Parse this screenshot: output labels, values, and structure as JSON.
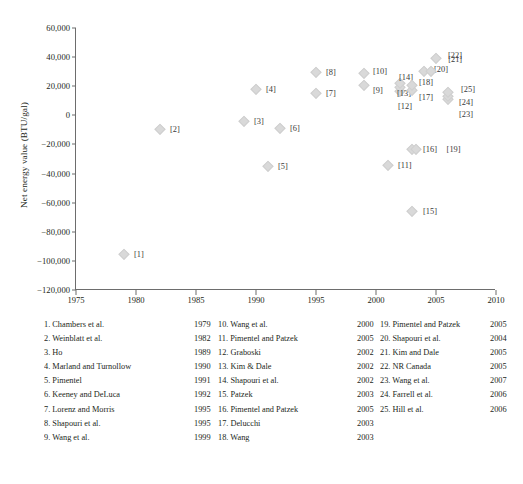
{
  "chart_data": {
    "type": "scatter",
    "title": "",
    "xlabel": "",
    "ylabel": "Net energy value (BTU/gal)",
    "xlim": [
      1975,
      2010
    ],
    "ylim": [
      -120000,
      60000
    ],
    "xticks": [
      "1975",
      "1980",
      "1985",
      "1990",
      "1995",
      "2000",
      "2005",
      "2010"
    ],
    "xtick_values": [
      1975,
      1980,
      1985,
      1990,
      1995,
      2000,
      2005,
      2010
    ],
    "yticks": [
      "60,000",
      "40,000",
      "20,000",
      "0",
      "−20,000",
      "−40,000",
      "−60,000",
      "−80,000",
      "−100,000",
      "−120,000"
    ],
    "ytick_values": [
      60000,
      40000,
      20000,
      0,
      -20000,
      -40000,
      -60000,
      -80000,
      -100000,
      -120000
    ],
    "grid": false,
    "legend": "none",
    "marker": "diamond",
    "marker_color": "#d9d9d9",
    "points": [
      {
        "id": "1",
        "label": "[1]",
        "x": 1979,
        "y": -95000,
        "lx": 10,
        "ly": 0
      },
      {
        "id": "2",
        "label": "[2]",
        "x": 1982,
        "y": -9500,
        "lx": 10,
        "ly": 0
      },
      {
        "id": "3",
        "label": "[3]",
        "x": 1989,
        "y": -4000,
        "lx": 10,
        "ly": 0
      },
      {
        "id": "4",
        "label": "[4]",
        "x": 1990,
        "y": 18000,
        "lx": 10,
        "ly": 0
      },
      {
        "id": "5",
        "label": "[5]",
        "x": 1991,
        "y": -35000,
        "lx": 10,
        "ly": 0
      },
      {
        "id": "6",
        "label": "[6]",
        "x": 1992,
        "y": -9000,
        "lx": 10,
        "ly": 0
      },
      {
        "id": "7",
        "label": "[7]",
        "x": 1995,
        "y": 15500,
        "lx": 10,
        "ly": 0
      },
      {
        "id": "8",
        "label": "[8]",
        "x": 1995,
        "y": 30000,
        "lx": 10,
        "ly": 0
      },
      {
        "id": "9",
        "label": "[9]",
        "x": 1999,
        "y": 20500,
        "lx": 9,
        "ly": 5
      },
      {
        "id": "10",
        "label": "[10]",
        "x": 1999,
        "y": 29000,
        "lx": 9,
        "ly": -2
      },
      {
        "id": "11",
        "label": "[11]",
        "x": 2001,
        "y": -34000,
        "lx": 10,
        "ly": 0
      },
      {
        "id": "12",
        "label": "[12]",
        "x": 2002,
        "y": 16500,
        "lx": -2,
        "ly": 15
      },
      {
        "id": "13",
        "label": "[13]",
        "x": 2002,
        "y": 19500,
        "lx": -3,
        "ly": 6
      },
      {
        "id": "14",
        "label": "[14]",
        "x": 2002,
        "y": 22500,
        "lx": -1,
        "ly": -6
      },
      {
        "id": "15",
        "label": "[15]",
        "x": 2003,
        "y": -66000,
        "lx": 11,
        "ly": 0
      },
      {
        "id": "16",
        "label": "[16]",
        "x": 2003,
        "y": -23000,
        "lx": 11,
        "ly": 0
      },
      {
        "id": "17",
        "label": "[17]",
        "x": 2003,
        "y": 17500,
        "lx": 7,
        "ly": 7
      },
      {
        "id": "18",
        "label": "[18]",
        "x": 2003,
        "y": 20500,
        "lx": 7,
        "ly": -3
      },
      {
        "id": "19",
        "label": "[19]",
        "x": 2003.3,
        "y": -23000,
        "lx": 31,
        "ly": 0
      },
      {
        "id": "20",
        "label": "[20]",
        "x": 2004,
        "y": 30500,
        "lx": 10,
        "ly": -2
      },
      {
        "id": "21",
        "label": "[21]",
        "x": 2004.6,
        "y": 30500,
        "lx": 17,
        "ly": -12
      },
      {
        "id": "22",
        "label": "[22]",
        "x": 2005,
        "y": 39500,
        "lx": 12,
        "ly": -3
      },
      {
        "id": "23",
        "label": "[23]",
        "x": 2006,
        "y": 11000,
        "lx": 11,
        "ly": 15
      },
      {
        "id": "24",
        "label": "[24]",
        "x": 2006,
        "y": 13500,
        "lx": 11,
        "ly": 6
      },
      {
        "id": "25",
        "label": "[25]",
        "x": 2006,
        "y": 16000,
        "lx": 13,
        "ly": -3
      }
    ]
  },
  "references": {
    "column1": [
      {
        "num": "1.",
        "name": "1. Chambers et al.",
        "year": "1979"
      },
      {
        "num": "2.",
        "name": "2. Weinblatt et al.",
        "year": "1982"
      },
      {
        "num": "3.",
        "name": "3. Ho",
        "year": "1989"
      },
      {
        "num": "4.",
        "name": "4. Marland and Turnollow",
        "year": "1990"
      },
      {
        "num": "5.",
        "name": "5. Pimentel",
        "year": "1991"
      },
      {
        "num": "6.",
        "name": "6. Keeney and DeLuca",
        "year": "1992"
      },
      {
        "num": "7.",
        "name": "7. Lorenz and Morris",
        "year": "1995"
      },
      {
        "num": "8.",
        "name": "8. Shapouri et al.",
        "year": "1995"
      },
      {
        "num": "9.",
        "name": "9. Wang et al.",
        "year": "1999"
      }
    ],
    "column2": [
      {
        "num": "10.",
        "name": "10. Wang et al.",
        "year": "2000"
      },
      {
        "num": "11.",
        "name": "11. Pimentel and Patzek",
        "year": "2005"
      },
      {
        "num": "12.",
        "name": "12. Graboski",
        "year": "2002"
      },
      {
        "num": "13.",
        "name": "13. Kim & Dale",
        "year": "2002"
      },
      {
        "num": "14.",
        "name": "14. Shapouri et al.",
        "year": "2002"
      },
      {
        "num": "15.",
        "name": "15. Patzek",
        "year": "2003"
      },
      {
        "num": "16.",
        "name": "16. Pimentel and Patzek",
        "year": "2005"
      },
      {
        "num": "17.",
        "name": "17. Delucchi",
        "year": "2003"
      },
      {
        "num": "18.",
        "name": "18. Wang",
        "year": "2003"
      }
    ],
    "column3": [
      {
        "num": "19.",
        "name": "19. Pimentel and Patzek",
        "year": "2005"
      },
      {
        "num": "20.",
        "name": "20. Shapouri et al.",
        "year": "2004"
      },
      {
        "num": "21.",
        "name": "21. Kim and Dale",
        "year": "2005"
      },
      {
        "num": "22.",
        "name": "22. NR Canada",
        "year": "2005"
      },
      {
        "num": "23.",
        "name": "23. Wang et al.",
        "year": "2007"
      },
      {
        "num": "24.",
        "name": "24. Farrell et al.",
        "year": "2006"
      },
      {
        "num": "25.",
        "name": "25. Hill et al.",
        "year": "2006"
      }
    ]
  }
}
